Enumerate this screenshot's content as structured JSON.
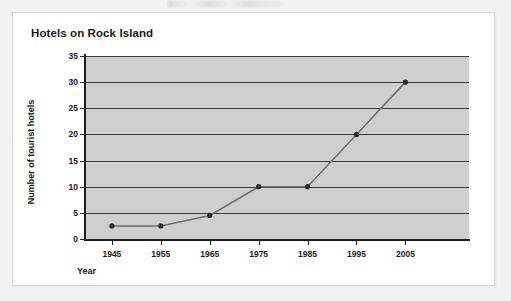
{
  "page": {
    "background_color": "#f2f2f2",
    "card_background_color": "#ffffff",
    "card_border_color": "#d8d8d8"
  },
  "chart_data": {
    "type": "line",
    "title": "Hotels on Rock Island",
    "xlabel": "Year",
    "ylabel": "Number of tourist hotels",
    "categories": [
      "1945",
      "1955",
      "1965",
      "1975",
      "1985",
      "1995",
      "2005"
    ],
    "values": [
      2.5,
      2.5,
      4.5,
      10,
      10,
      20,
      30
    ],
    "x": [
      1945,
      1955,
      1965,
      1975,
      1985,
      1995,
      2005
    ],
    "ylim": [
      0,
      35
    ],
    "yticks": [
      "0",
      "5",
      "10",
      "15",
      "20",
      "25",
      "30",
      "35"
    ],
    "ytick_values": [
      0,
      5,
      10,
      15,
      20,
      25,
      30,
      35
    ],
    "xticks": [
      "1945",
      "1955",
      "1965",
      "1975",
      "1985",
      "1995",
      "2005"
    ],
    "grid": true,
    "grid_axis": "y",
    "legend": false,
    "legend_position": "none",
    "plot_background_color": "#cfcfcf",
    "gridline_color": "#3a3a3a",
    "line_color": "#6e6e6e",
    "marker_color": "#2b2b2b",
    "axis_color": "#1c1c1c",
    "series": [
      {
        "name": "Number of tourist hotels",
        "values": [
          2.5,
          2.5,
          4.5,
          10,
          10,
          20,
          30
        ]
      }
    ]
  }
}
